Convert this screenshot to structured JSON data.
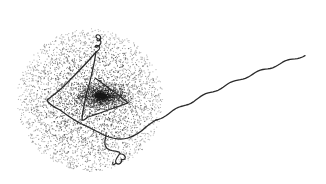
{
  "illustration": {
    "subject": "stippled micrograph-style drawing of a particle with an extruded strand",
    "colors": {
      "background": "#ffffff",
      "stipple": "#1a1a1a",
      "strand": "#2a2a2a"
    },
    "features": [
      "stippled circular halo",
      "dense dark core",
      "looped strand forming a triangular path",
      "top curl loop",
      "bottom curl loop",
      "long wavy tail extending to upper right"
    ]
  }
}
